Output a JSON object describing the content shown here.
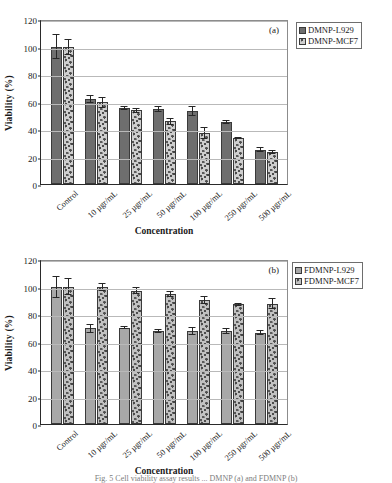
{
  "figure": {
    "background": "#ffffff",
    "bottom_caption_partial": "Fig. 5 Cell viability assay results ... DMNP (a) and FDMNP (b)"
  },
  "panels": [
    {
      "tag": "(a)",
      "ylabel": "Viability (%)",
      "xlabel": "Concentration",
      "legend": [
        {
          "label": "DMNP-L929",
          "swatch": "#6e6e6e"
        },
        {
          "label": "DMNP-MCF7",
          "swatch": "#8a8a8a"
        }
      ],
      "chart_data": {
        "type": "bar",
        "title": "",
        "xlabel": "Concentration",
        "ylabel": "Viability (%)",
        "ylim": [
          0,
          120
        ],
        "yticks": [
          0,
          20,
          40,
          60,
          80,
          100,
          120
        ],
        "grid": true,
        "legend_position": "top-right-outside",
        "categories": [
          "Control",
          "10 µgr/mL",
          "25 µgr/mL",
          "50 µgr/mL",
          "100 µgr/mL",
          "250 µgr/mL",
          "500 µgr/mL"
        ],
        "series": [
          {
            "name": "DMNP-L929",
            "values": [
              100,
              62,
              55.5,
              54.5,
              53,
              45,
              25
            ],
            "errors": [
              9,
              3,
              1.5,
              2,
              3.5,
              1.5,
              2
            ]
          },
          {
            "name": "DMNP-MCF7",
            "values": [
              99.5,
              59.5,
              53.5,
              45.5,
              37,
              33.5,
              23.5
            ],
            "errors": [
              6,
              4,
              2,
              2.5,
              4.5,
              1,
              1.5
            ]
          }
        ]
      }
    },
    {
      "tag": "(b)",
      "ylabel": "Viability (%)",
      "xlabel": "Concentration",
      "legend": [
        {
          "label": "FDMNP-L929",
          "swatch": "#a8a8a8"
        },
        {
          "label": "FDMNP-MCF7",
          "swatch": "#9a9a9a"
        }
      ],
      "chart_data": {
        "type": "bar",
        "title": "",
        "xlabel": "Concentration",
        "ylabel": "Viability (%)",
        "ylim": [
          0,
          120
        ],
        "yticks": [
          0,
          20,
          40,
          60,
          80,
          100,
          120
        ],
        "grid": true,
        "legend_position": "top-right-outside",
        "categories": [
          "Control",
          "10 µgr/mL",
          "25 µgr/mL",
          "50 µgr/mL",
          "100 µgr/mL",
          "250 µgr/mL",
          "500 µgr/mL"
        ],
        "series": [
          {
            "name": "FDMNP-L929",
            "values": [
              100,
              69.5,
              70,
              67.5,
              67.5,
              67.5,
              66.5
            ],
            "errors": [
              8,
              3,
              1,
              1.5,
              3,
              2,
              2
            ]
          },
          {
            "name": "FDMNP-MCF7",
            "values": [
              100,
              99.5,
              97,
              94.5,
              90,
              87,
              87.5
            ],
            "errors": [
              6,
              3,
              2.5,
              2,
              3,
              1,
              4
            ]
          }
        ]
      }
    }
  ]
}
